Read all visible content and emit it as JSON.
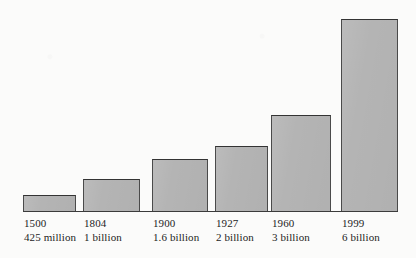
{
  "chart_data": {
    "type": "bar",
    "title": "",
    "subtitle": "",
    "xlabel": "",
    "ylabel": "",
    "grid": false,
    "legend": false,
    "axis": {
      "baseline_visible": true,
      "y_axis_visible": false,
      "ylim": [
        0,
        6
      ]
    },
    "categories": [
      "1500",
      "1804",
      "1900",
      "1927",
      "1960",
      "1999"
    ],
    "value_labels": [
      "425 million",
      "1 billion",
      "1.6 billion",
      "2 billion",
      "3 billion",
      "6 billion"
    ],
    "values": [
      0.425,
      1,
      1.6,
      2,
      3,
      6
    ],
    "units": "billions of people",
    "bars": [
      {
        "year": "1500",
        "value_label": "425 million",
        "value": 0.425,
        "x": 23,
        "width": 53,
        "height": 16
      },
      {
        "year": "1804",
        "value_label": "1 billion",
        "value": 1,
        "x": 83,
        "width": 57,
        "height": 32
      },
      {
        "year": "1900",
        "value_label": "1.6 billion",
        "value": 1.6,
        "x": 152,
        "width": 56,
        "height": 52
      },
      {
        "year": "1927",
        "value_label": "2 billion",
        "value": 2,
        "x": 215,
        "width": 53,
        "height": 65
      },
      {
        "year": "1960",
        "value_label": "3 billion",
        "value": 3,
        "x": 271,
        "width": 60,
        "height": 96
      },
      {
        "year": "1999",
        "value_label": "6 billion",
        "value": 6,
        "x": 341,
        "width": 57,
        "height": 192
      }
    ],
    "colors": {
      "bar_fill": "#b4b4b4",
      "bar_stroke": "#4a4a4a",
      "axis": "#3b3b3b",
      "text": "#1d1d1d",
      "background": "#fbfbfa"
    },
    "geometry": {
      "baseline_y": 211,
      "baseline_x_start": 23,
      "baseline_x_end": 398,
      "label_top_y": 216
    }
  }
}
